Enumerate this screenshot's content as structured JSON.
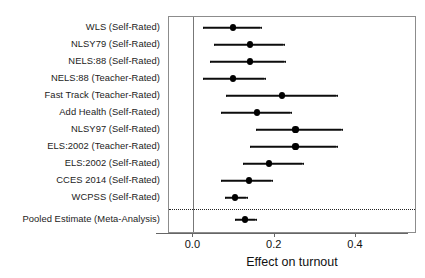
{
  "chart_data": {
    "type": "scatter",
    "title": "",
    "subtitle": "",
    "xlabel": "Effect on turnout",
    "ylabel": "",
    "xlim": [
      -0.06,
      0.55
    ],
    "xticks": [
      0.0,
      0.2,
      0.4
    ],
    "xtick_labels": [
      "0.0",
      "0.2",
      "0.4"
    ],
    "grid": false,
    "legend": "none",
    "reference_line": 0.0,
    "separator_after": "WCPSS (Self-Rated)",
    "categories": [
      "WLS (Self-Rated)",
      "NLSY79 (Self-Rated)",
      "NELS:88 (Self-Rated)",
      "NELS:88 (Teacher-Rated)",
      "Fast Track (Teacher-Rated)",
      "Add Health (Self-Rated)",
      "NLSY97 (Self-Rated)",
      "ELS:2002 (Teacher-Rated)",
      "ELS:2002 (Self-Rated)",
      "CCES 2014 (Self-Rated)",
      "WCPSS (Self-Rated)",
      "Pooled Estimate (Meta-Analysis)"
    ],
    "points": [
      {
        "label": "WLS (Self-Rated)",
        "estimate": 0.097,
        "ci_low": 0.023,
        "ci_high": 0.166
      },
      {
        "label": "NLSY79 (Self-Rated)",
        "estimate": 0.14,
        "ci_low": 0.051,
        "ci_high": 0.223
      },
      {
        "label": "NELS:88 (Self-Rated)",
        "estimate": 0.14,
        "ci_low": 0.04,
        "ci_high": 0.226
      },
      {
        "label": "NELS:88 (Teacher-Rated)",
        "estimate": 0.097,
        "ci_low": 0.023,
        "ci_high": 0.175
      },
      {
        "label": "Fast Track (Teacher-Rated)",
        "estimate": 0.217,
        "ci_low": 0.08,
        "ci_high": 0.354
      },
      {
        "label": "Add Health (Self-Rated)",
        "estimate": 0.157,
        "ci_low": 0.069,
        "ci_high": 0.24
      },
      {
        "label": "NLSY97 (Self-Rated)",
        "estimate": 0.251,
        "ci_low": 0.154,
        "ci_high": 0.366
      },
      {
        "label": "ELS:2002 (Teacher-Rated)",
        "estimate": 0.251,
        "ci_low": 0.14,
        "ci_high": 0.354
      },
      {
        "label": "ELS:2002 (Self-Rated)",
        "estimate": 0.186,
        "ci_low": 0.123,
        "ci_high": 0.269
      },
      {
        "label": "CCES 2014 (Self-Rated)",
        "estimate": 0.137,
        "ci_low": 0.069,
        "ci_high": 0.194
      },
      {
        "label": "WCPSS (Self-Rated)",
        "estimate": 0.103,
        "ci_low": 0.077,
        "ci_high": 0.131
      },
      {
        "label": "Pooled Estimate (Meta-Analysis)",
        "estimate": 0.126,
        "ci_low": 0.103,
        "ci_high": 0.154
      }
    ]
  },
  "colors": {
    "point": "#000000",
    "interval": "#0d0d0d",
    "panel_border": "#8c8c8c",
    "zero_line": "#777777",
    "separator": "#222222",
    "background": "#ffffff"
  }
}
